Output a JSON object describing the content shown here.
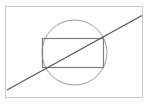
{
  "figure": {
    "background_color": "#ffffff",
    "canvas": {
      "width": 152,
      "height": 107
    },
    "frame": {
      "name": "outer-frame",
      "x": 5.5,
      "y": 6.5,
      "width": 137,
      "height": 91,
      "stroke": "#c8c8c8",
      "stroke_width": 1,
      "fill": "none"
    },
    "circle": {
      "name": "circle",
      "cx": 74.5,
      "cy": 52.5,
      "r": 32.5,
      "stroke": "#9a9a9a",
      "stroke_width": 1,
      "fill": "none"
    },
    "rectangle": {
      "name": "inscribed-rectangle",
      "x": 42.5,
      "y": 38.5,
      "width": 61,
      "height": 29,
      "stroke": "#7d7d7d",
      "stroke_width": 1.2,
      "fill": "none"
    },
    "diagonal": {
      "name": "diagonal-line",
      "x1": 7,
      "y1": 90,
      "x2": 142,
      "y2": 15.5,
      "stroke": "#555555",
      "stroke_width": 1.2
    }
  }
}
